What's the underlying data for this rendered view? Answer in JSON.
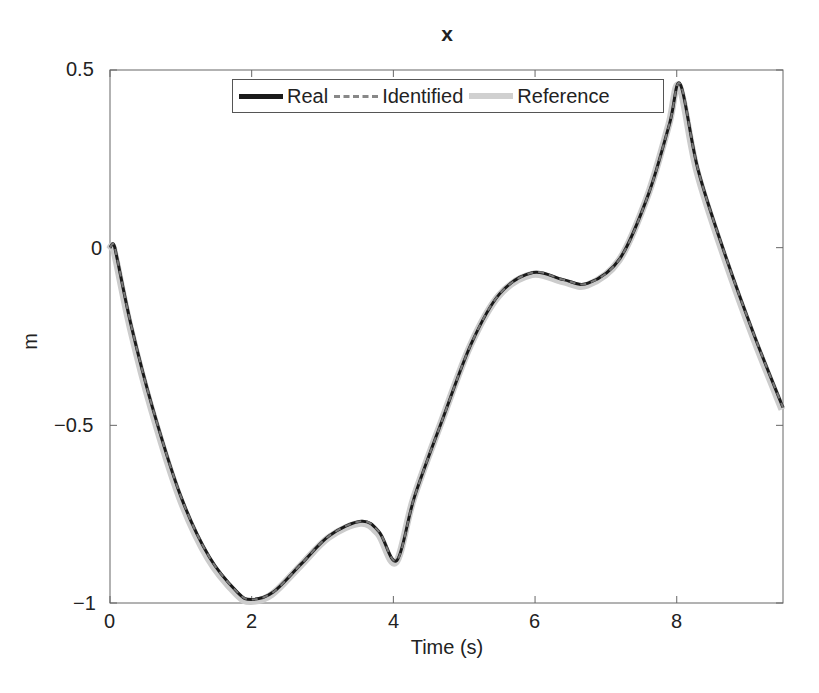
{
  "chart_data": {
    "type": "line",
    "title": "x",
    "xlabel": "Time (s)",
    "ylabel": "m",
    "xlim": [
      0,
      9.5
    ],
    "ylim": [
      -1,
      0.5
    ],
    "xticks": [
      "0",
      "2",
      "4",
      "6",
      "8"
    ],
    "yticks": [
      "0.5",
      "0",
      "−0.5",
      "−1"
    ],
    "grid": false,
    "legend_position": "top (inside)",
    "series": [
      {
        "name": "Real",
        "style": "solid",
        "color": "#1a1a1a",
        "width": 3
      },
      {
        "name": "Identified",
        "style": "dashed",
        "color": "#777777",
        "width": 2
      },
      {
        "name": "Reference",
        "style": "solid",
        "color": "#cccccc",
        "width": 7
      }
    ],
    "x": [
      0,
      0.05,
      0.1,
      0.3,
      0.6,
      1.0,
      1.4,
      1.8,
      2.0,
      2.3,
      2.7,
      3.1,
      3.55,
      3.8,
      4.05,
      4.3,
      4.7,
      5.1,
      5.5,
      5.97,
      6.4,
      6.75,
      7.2,
      7.6,
      7.9,
      8.05,
      8.3,
      8.7,
      9.1,
      9.5
    ],
    "values": [
      0.0,
      0.01,
      -0.03,
      -0.22,
      -0.45,
      -0.7,
      -0.87,
      -0.97,
      -0.99,
      -0.97,
      -0.89,
      -0.81,
      -0.77,
      -0.8,
      -0.88,
      -0.7,
      -0.48,
      -0.27,
      -0.13,
      -0.07,
      -0.09,
      -0.1,
      -0.03,
      0.15,
      0.35,
      0.46,
      0.22,
      -0.03,
      -0.25,
      -0.45
    ]
  },
  "legend": {
    "items": [
      "Real",
      "Identified",
      "Reference"
    ]
  }
}
